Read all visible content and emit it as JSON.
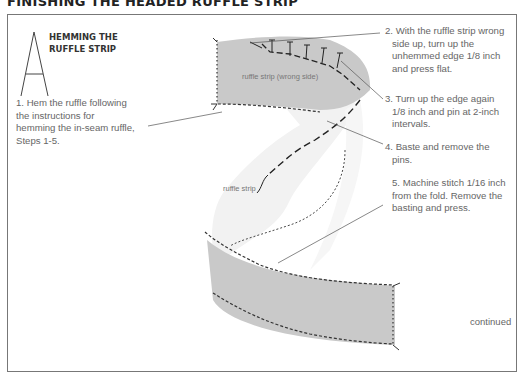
{
  "page": {
    "title": "FINISHING THE HEADED RUFFLE STRIP",
    "continued": "continued"
  },
  "section": {
    "drop_cap_letter": "A",
    "heading_line1": "HEMMING THE",
    "heading_line2": "RUFFLE STRIP"
  },
  "steps": [
    {
      "number": 1,
      "text_lines": [
        "1. Hem the ruffle following",
        "the instructions for",
        "hemming the in-seam ruffle,",
        "Steps 1-5."
      ]
    },
    {
      "number": 2,
      "text_lines": [
        "2. With the ruffle strip wrong",
        "side up, turn up the",
        "unhemmed edge 1/8 inch",
        "and press flat."
      ]
    },
    {
      "number": 3,
      "text_lines": [
        "3. Turn up the edge again",
        "1/8 inch and pin at 2-inch",
        "intervals."
      ]
    },
    {
      "number": 4,
      "text_lines": [
        "4. Baste and remove the",
        "pins."
      ]
    },
    {
      "number": 5,
      "text_lines": [
        "5. Machine stitch 1/16 inch",
        "from the fold. Remove the",
        "basting and press."
      ]
    }
  ],
  "illustration": {
    "labels": {
      "wrong_side": "ruffle strip (wrong side)",
      "strip": "ruffle strip"
    },
    "colors": {
      "fabric_wrong_side": "#c8c8c8",
      "fabric_right_side": "#f4f4f4",
      "stitch": "#333333"
    }
  }
}
